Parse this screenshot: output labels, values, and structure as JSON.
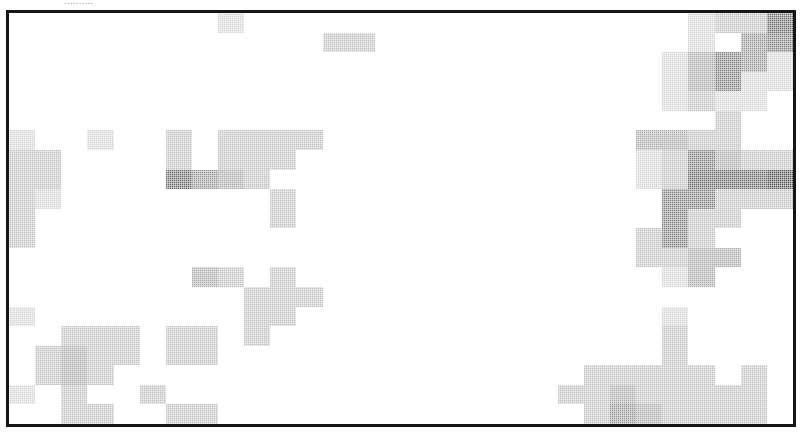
{
  "page": {
    "caption_sliver": "..........",
    "background_color": "#ffffff"
  },
  "plot": {
    "frame_color": "#15161a",
    "frame_width_px": 3,
    "empty_cell_color": "#ffffff",
    "max_cell_color": "#2b2b2b",
    "render_style": "halftone-dither"
  },
  "chart_data": {
    "type": "heatmap",
    "title": "",
    "xlabel": "",
    "ylabel": "",
    "grid": false,
    "legend": "none",
    "columns": 30,
    "rows": 21,
    "colorscale": {
      "name": "grayscale-inverted",
      "min_value": 0,
      "max_value": 10,
      "min_color": "#ffffff",
      "max_color": "#2b2b2b"
    },
    "xticklabels": [],
    "yticklabels": [],
    "values": [
      [
        0,
        0,
        0,
        0,
        0,
        0,
        0,
        0,
        2,
        0,
        0,
        0,
        0,
        0,
        0,
        0,
        0,
        0,
        0,
        0,
        0,
        0,
        0,
        0,
        0,
        0,
        2,
        3,
        3,
        7
      ],
      [
        0,
        0,
        0,
        0,
        0,
        0,
        0,
        0,
        0,
        0,
        0,
        0,
        3,
        3,
        0,
        0,
        0,
        0,
        0,
        0,
        0,
        0,
        0,
        0,
        0,
        0,
        2,
        0,
        5,
        6
      ],
      [
        0,
        0,
        0,
        0,
        0,
        0,
        0,
        0,
        0,
        0,
        0,
        0,
        0,
        0,
        0,
        0,
        0,
        0,
        0,
        0,
        0,
        0,
        0,
        0,
        0,
        2,
        4,
        6,
        5,
        2
      ],
      [
        0,
        0,
        0,
        0,
        0,
        0,
        0,
        0,
        0,
        0,
        0,
        0,
        0,
        0,
        0,
        0,
        0,
        0,
        0,
        0,
        0,
        0,
        0,
        0,
        0,
        2,
        4,
        6,
        2,
        2
      ],
      [
        0,
        0,
        0,
        0,
        0,
        0,
        0,
        0,
        0,
        0,
        0,
        0,
        0,
        0,
        0,
        0,
        0,
        0,
        0,
        0,
        0,
        0,
        0,
        0,
        0,
        2,
        3,
        2,
        2,
        0
      ],
      [
        0,
        0,
        0,
        0,
        0,
        0,
        0,
        0,
        0,
        0,
        0,
        0,
        0,
        0,
        0,
        0,
        0,
        0,
        0,
        0,
        0,
        0,
        0,
        0,
        0,
        0,
        0,
        3,
        0,
        0
      ],
      [
        2,
        0,
        0,
        2,
        0,
        0,
        3,
        0,
        3,
        3,
        3,
        3,
        0,
        0,
        0,
        0,
        0,
        0,
        0,
        0,
        0,
        0,
        0,
        0,
        4,
        4,
        3,
        3,
        0,
        0
      ],
      [
        3,
        3,
        0,
        0,
        0,
        0,
        3,
        0,
        3,
        3,
        3,
        0,
        0,
        0,
        0,
        0,
        0,
        0,
        0,
        0,
        0,
        0,
        0,
        0,
        2,
        3,
        6,
        4,
        3,
        3
      ],
      [
        3,
        3,
        0,
        0,
        0,
        0,
        7,
        5,
        4,
        3,
        0,
        0,
        0,
        0,
        0,
        0,
        0,
        0,
        0,
        0,
        0,
        0,
        0,
        0,
        2,
        3,
        7,
        7,
        7,
        8
      ],
      [
        3,
        2,
        0,
        0,
        0,
        0,
        0,
        0,
        0,
        0,
        3,
        0,
        0,
        0,
        0,
        0,
        0,
        0,
        0,
        0,
        0,
        0,
        0,
        0,
        0,
        6,
        6,
        3,
        3,
        3
      ],
      [
        3,
        0,
        0,
        0,
        0,
        0,
        0,
        0,
        0,
        0,
        3,
        0,
        0,
        0,
        0,
        0,
        0,
        0,
        0,
        0,
        0,
        0,
        0,
        0,
        0,
        6,
        3,
        3,
        0,
        0
      ],
      [
        3,
        0,
        0,
        0,
        0,
        0,
        0,
        0,
        0,
        0,
        0,
        0,
        0,
        0,
        0,
        0,
        0,
        0,
        0,
        0,
        0,
        0,
        0,
        0,
        3,
        6,
        3,
        0,
        0,
        0
      ],
      [
        0,
        0,
        0,
        0,
        0,
        0,
        0,
        0,
        0,
        0,
        0,
        0,
        0,
        0,
        0,
        0,
        0,
        0,
        0,
        0,
        0,
        0,
        0,
        0,
        3,
        3,
        4,
        4,
        0,
        0
      ],
      [
        0,
        0,
        0,
        0,
        0,
        0,
        0,
        4,
        3,
        0,
        3,
        0,
        0,
        0,
        0,
        0,
        0,
        0,
        0,
        0,
        0,
        0,
        0,
        0,
        0,
        2,
        4,
        0,
        0,
        0
      ],
      [
        0,
        0,
        0,
        0,
        0,
        0,
        0,
        0,
        0,
        3,
        3,
        3,
        0,
        0,
        0,
        0,
        0,
        0,
        0,
        0,
        0,
        0,
        0,
        0,
        0,
        0,
        0,
        0,
        0,
        0
      ],
      [
        2,
        0,
        0,
        0,
        0,
        0,
        0,
        0,
        0,
        3,
        3,
        0,
        0,
        0,
        0,
        0,
        0,
        0,
        0,
        0,
        0,
        0,
        0,
        0,
        0,
        2,
        0,
        0,
        0,
        0
      ],
      [
        0,
        0,
        3,
        3,
        3,
        0,
        3,
        3,
        0,
        3,
        0,
        0,
        0,
        0,
        0,
        0,
        0,
        0,
        0,
        0,
        0,
        0,
        0,
        0,
        0,
        3,
        0,
        0,
        0,
        0
      ],
      [
        0,
        3,
        4,
        3,
        3,
        0,
        3,
        3,
        0,
        0,
        0,
        0,
        0,
        0,
        0,
        0,
        0,
        0,
        0,
        0,
        0,
        0,
        0,
        0,
        0,
        3,
        0,
        0,
        0,
        0
      ],
      [
        0,
        3,
        4,
        3,
        0,
        0,
        0,
        0,
        0,
        0,
        0,
        0,
        0,
        0,
        0,
        0,
        0,
        0,
        0,
        0,
        0,
        0,
        3,
        3,
        3,
        3,
        3,
        0,
        3,
        0
      ],
      [
        2,
        0,
        3,
        0,
        0,
        3,
        0,
        0,
        0,
        0,
        0,
        0,
        0,
        0,
        0,
        0,
        0,
        0,
        0,
        0,
        0,
        3,
        3,
        4,
        3,
        3,
        3,
        3,
        3,
        0
      ],
      [
        0,
        0,
        3,
        3,
        0,
        0,
        3,
        3,
        0,
        0,
        0,
        0,
        0,
        0,
        0,
        0,
        0,
        0,
        0,
        0,
        0,
        0,
        3,
        5,
        4,
        3,
        3,
        3,
        3,
        0
      ]
    ]
  }
}
